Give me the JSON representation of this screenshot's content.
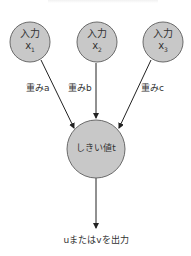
{
  "diagram": {
    "inputs": [
      {
        "label": "入力",
        "sub": "x",
        "index": "1"
      },
      {
        "label": "入力",
        "sub": "x",
        "index": "2"
      },
      {
        "label": "入力",
        "sub": "x",
        "index": "3"
      }
    ],
    "weights": [
      "重みa",
      "重みb",
      "重みc"
    ],
    "threshold_node": "しきい値t",
    "output_label": "uまたはvを出力",
    "colors": {
      "node_fill": "#c8c8c8",
      "node_stroke": "#6a6a6a",
      "line": "#222222"
    }
  }
}
